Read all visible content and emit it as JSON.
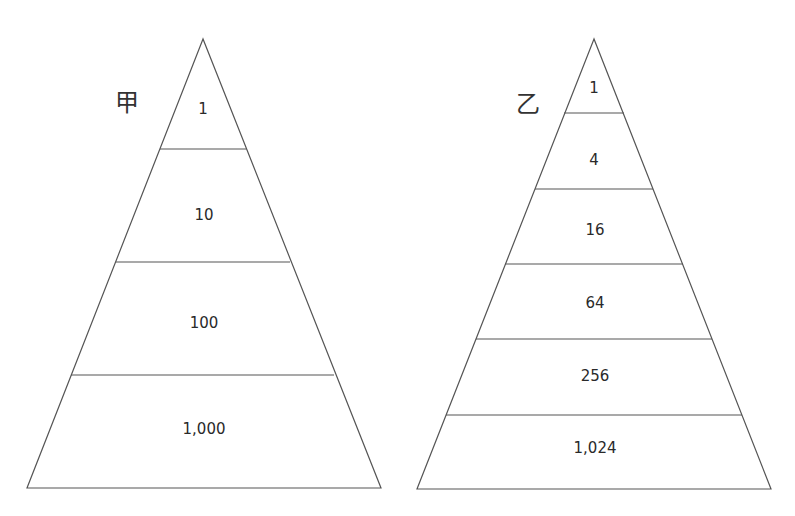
{
  "pyramids": [
    {
      "title": "甲",
      "levels": [
        "1",
        "10",
        "100",
        "1,000"
      ],
      "values": [
        1,
        10,
        100,
        1000
      ]
    },
    {
      "title": "乙",
      "levels": [
        "1",
        "4",
        "16",
        "64",
        "256",
        "1,024"
      ],
      "values": [
        1,
        4,
        16,
        64,
        256,
        1024
      ]
    }
  ],
  "colors": {
    "line": "#555555",
    "text": "#2a2a2a",
    "background": "#ffffff"
  }
}
